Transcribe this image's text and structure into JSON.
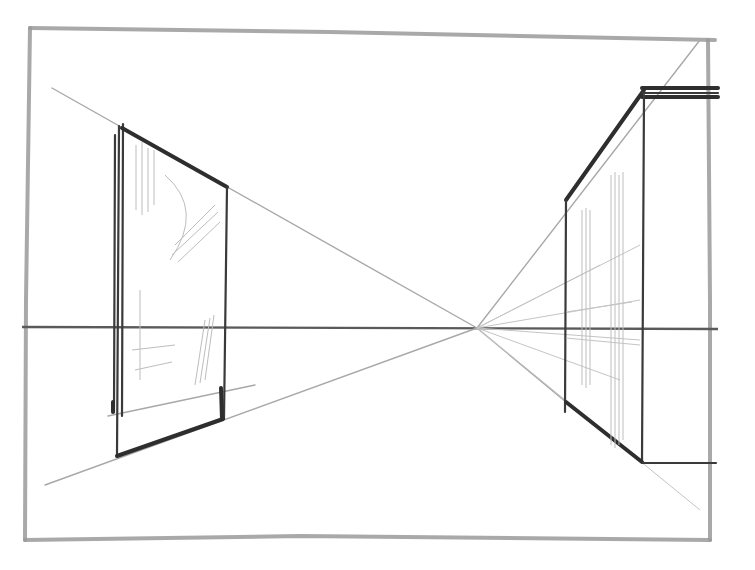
{
  "drawing": {
    "subject": "one-point perspective pencil sketch",
    "vanishing_point": [
      477,
      328
    ],
    "horizon_y": 328,
    "frame": {
      "top_left": [
        30,
        28
      ],
      "top_right": [
        715,
        40
      ],
      "bottom_right": [
        710,
        540
      ],
      "bottom_left": [
        25,
        540
      ]
    },
    "left_wall": {
      "near_top": [
        120,
        128
      ],
      "far_top": [
        227,
        187
      ],
      "near_bottom": [
        116,
        456
      ],
      "far_bottom": [
        223,
        419
      ]
    },
    "right_wall": {
      "far_top": [
        566,
        200
      ],
      "near_top": [
        644,
        90
      ],
      "far_bottom": [
        566,
        402
      ],
      "near_bottom": [
        642,
        462
      ],
      "roof_extension_x": 718,
      "bottom_extension_x": 718
    },
    "colors": {
      "paper": "#ffffff",
      "pencil_dark": "#2e2e2e",
      "pencil_light": "#a8a8a8"
    }
  }
}
